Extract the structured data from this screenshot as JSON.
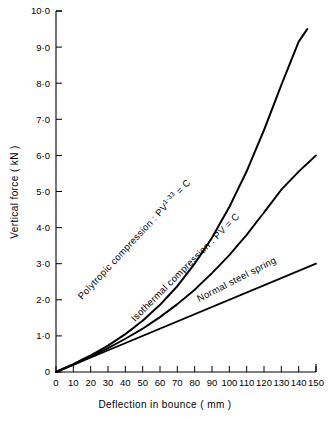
{
  "chart_data": {
    "type": "line",
    "title": "",
    "xlabel": "Deflection in bounce   ( mm )",
    "ylabel": "Vertical force   ( kN )",
    "xlim": [
      0,
      150
    ],
    "ylim": [
      0,
      10
    ],
    "grid": false,
    "legend_position": "inline-curve-labels",
    "xticks": [
      0,
      10,
      20,
      30,
      40,
      50,
      60,
      70,
      80,
      90,
      100,
      110,
      120,
      130,
      140,
      150
    ],
    "xtick_labels": [
      "0",
      "10",
      "20",
      "30",
      "40",
      "50",
      "60",
      "70",
      "80",
      "90",
      "100",
      "110",
      "120",
      "130",
      "140",
      "150"
    ],
    "yticks": [
      0,
      1,
      2,
      3,
      4,
      5,
      6,
      7,
      8,
      9,
      10
    ],
    "ytick_labels": [
      "0",
      "1·0",
      "2·0",
      "3·0",
      "4·0",
      "5·0",
      "6·0",
      "7·0",
      "8·0",
      "9·0",
      "10·0"
    ],
    "series": [
      {
        "name": "Polytropic compression",
        "label": "Polytropic compression : PV",
        "label_exponent": "1·33",
        "label_suffix": "= C",
        "x": [
          0,
          10,
          20,
          30,
          40,
          50,
          60,
          70,
          80,
          90,
          100,
          110,
          120,
          130,
          140,
          145
        ],
        "y": [
          0.0,
          0.22,
          0.46,
          0.73,
          1.05,
          1.42,
          1.86,
          2.38,
          3.0,
          3.72,
          4.57,
          5.56,
          6.7,
          7.95,
          9.15,
          9.5
        ]
      },
      {
        "name": "Isothermal compression",
        "label": "Isothermal compression : PV = C",
        "label_exponent": "",
        "label_suffix": "",
        "x": [
          0,
          10,
          20,
          30,
          40,
          50,
          60,
          70,
          80,
          90,
          100,
          110,
          120,
          130,
          140,
          150
        ],
        "y": [
          0.0,
          0.2,
          0.42,
          0.66,
          0.92,
          1.2,
          1.52,
          1.88,
          2.28,
          2.74,
          3.24,
          3.8,
          4.42,
          5.05,
          5.55,
          6.0
        ]
      },
      {
        "name": "Normal steel spring",
        "label": "Normal steel spring",
        "label_exponent": "",
        "label_suffix": "",
        "x": [
          0,
          150
        ],
        "y": [
          0.0,
          3.0
        ]
      }
    ]
  }
}
